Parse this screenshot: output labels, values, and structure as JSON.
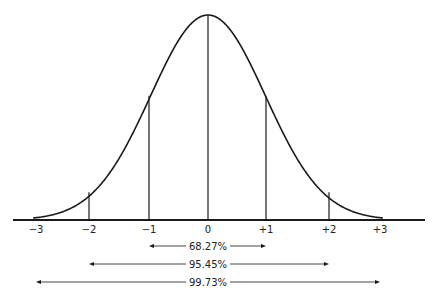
{
  "diagram": {
    "type": "normal-distribution",
    "ticks": [
      {
        "label": "−3",
        "sigma": -3
      },
      {
        "label": "−2",
        "sigma": -2
      },
      {
        "label": "−1",
        "sigma": -1
      },
      {
        "label": "0",
        "sigma": 0
      },
      {
        "label": "+1",
        "sigma": 1
      },
      {
        "label": "+2",
        "sigma": 2
      },
      {
        "label": "+3",
        "sigma": 3
      }
    ],
    "ranges": [
      {
        "label": "68.27%",
        "from": -1,
        "to": 1
      },
      {
        "label": "95.45%",
        "from": -2,
        "to": 2
      },
      {
        "label": "99.73%",
        "from": -3,
        "to": 3
      }
    ],
    "line_color": "#1a1a1a"
  }
}
